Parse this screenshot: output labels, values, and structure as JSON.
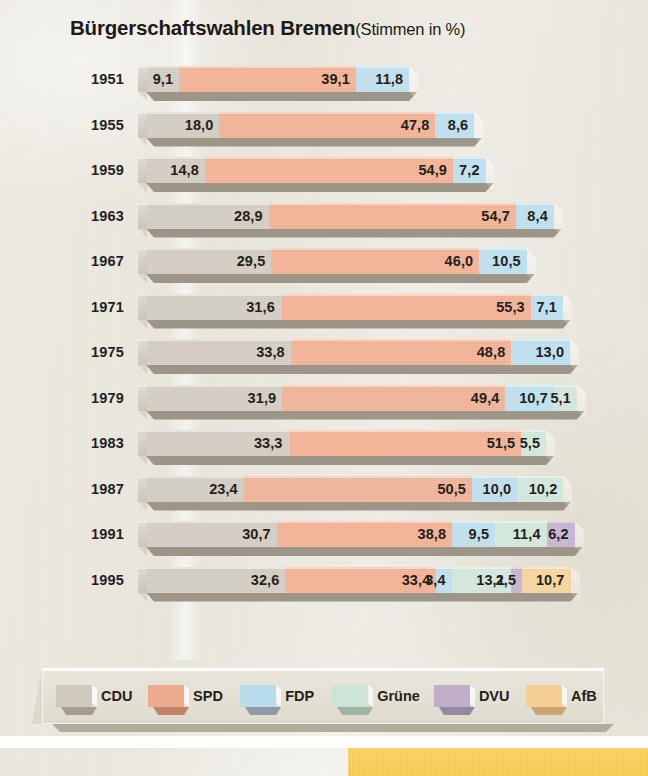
{
  "title": {
    "main": "Bürgerschaftswahlen Bremen",
    "sub": "(Stimmen in %)"
  },
  "legend": {
    "items": [
      {
        "label": "CDU",
        "color": "#cfc8bc",
        "shade": "#a59c8b",
        "key": "cdu"
      },
      {
        "label": "SPD",
        "color": "#eeac8e",
        "shade": "#c2836a",
        "key": "spd"
      },
      {
        "label": "FDP",
        "color": "#b9dcec",
        "shade": "#8d99a6",
        "key": "fdp"
      },
      {
        "label": "Grüne",
        "color": "#cfe4d8",
        "shade": "#9bb4a4",
        "key": "gruene"
      },
      {
        "label": "DVU",
        "color": "#c0aecb",
        "shade": "#9589a0",
        "key": "dvu"
      },
      {
        "label": "AfB",
        "color": "#f5cf94",
        "shade": "#c9a673",
        "key": "afb"
      }
    ]
  },
  "chart_data": {
    "type": "bar",
    "orientation": "horizontal",
    "stacked": true,
    "xlabel": "",
    "ylabel": "",
    "value_suffix": "%",
    "decimal_separator": ",",
    "categories": [
      "1951",
      "1955",
      "1959",
      "1963",
      "1967",
      "1971",
      "1975",
      "1979",
      "1983",
      "1987",
      "1991",
      "1995"
    ],
    "series": [
      {
        "name": "CDU",
        "color": "#cfc8bc",
        "values": [
          9.1,
          18.0,
          14.8,
          28.9,
          29.5,
          31.6,
          33.8,
          31.9,
          33.3,
          23.4,
          30.7,
          32.6
        ]
      },
      {
        "name": "SPD",
        "color": "#eeac8e",
        "values": [
          39.1,
          47.8,
          54.9,
          54.7,
          46.0,
          55.3,
          48.8,
          49.4,
          51.5,
          50.5,
          38.8,
          33.4
        ]
      },
      {
        "name": "FDP",
        "color": "#b9dcec",
        "values": [
          11.8,
          8.6,
          7.2,
          8.4,
          10.5,
          7.1,
          13.0,
          10.7,
          null,
          10.0,
          9.5,
          3.4
        ]
      },
      {
        "name": "Grüne",
        "color": "#cfe4d8",
        "values": [
          null,
          null,
          null,
          null,
          null,
          null,
          null,
          5.1,
          5.5,
          10.2,
          11.4,
          13.1
        ]
      },
      {
        "name": "DVU",
        "color": "#c0aecb",
        "values": [
          null,
          null,
          null,
          null,
          null,
          null,
          null,
          null,
          null,
          null,
          6.2,
          2.5
        ]
      },
      {
        "name": "AfB",
        "color": "#f5cf94",
        "values": [
          null,
          null,
          null,
          null,
          null,
          null,
          null,
          null,
          null,
          null,
          null,
          10.7
        ]
      }
    ],
    "rows": [
      {
        "year": "1951",
        "segments": [
          {
            "party": "CDU",
            "label": "9,1",
            "value": 9.1
          },
          {
            "party": "SPD",
            "label": "39,1",
            "value": 39.1
          },
          {
            "party": "FDP",
            "label": "11,8",
            "value": 11.8
          }
        ]
      },
      {
        "year": "1955",
        "segments": [
          {
            "party": "CDU",
            "label": "18,0",
            "value": 18.0
          },
          {
            "party": "SPD",
            "label": "47,8",
            "value": 47.8
          },
          {
            "party": "FDP",
            "label": "8,6",
            "value": 8.6
          }
        ]
      },
      {
        "year": "1959",
        "segments": [
          {
            "party": "CDU",
            "label": "14,8",
            "value": 14.8
          },
          {
            "party": "SPD",
            "label": "54,9",
            "value": 54.9
          },
          {
            "party": "FDP",
            "label": "7,2",
            "value": 7.2
          }
        ]
      },
      {
        "year": "1963",
        "segments": [
          {
            "party": "CDU",
            "label": "28,9",
            "value": 28.9
          },
          {
            "party": "SPD",
            "label": "54,7",
            "value": 54.7
          },
          {
            "party": "FDP",
            "label": "8,4",
            "value": 8.4
          }
        ]
      },
      {
        "year": "1967",
        "segments": [
          {
            "party": "CDU",
            "label": "29,5",
            "value": 29.5
          },
          {
            "party": "SPD",
            "label": "46,0",
            "value": 46.0
          },
          {
            "party": "FDP",
            "label": "10,5",
            "value": 10.5
          }
        ]
      },
      {
        "year": "1971",
        "segments": [
          {
            "party": "CDU",
            "label": "31,6",
            "value": 31.6
          },
          {
            "party": "SPD",
            "label": "55,3",
            "value": 55.3
          },
          {
            "party": "FDP",
            "label": "7,1",
            "value": 7.1
          }
        ]
      },
      {
        "year": "1975",
        "segments": [
          {
            "party": "CDU",
            "label": "33,8",
            "value": 33.8
          },
          {
            "party": "SPD",
            "label": "48,8",
            "value": 48.8
          },
          {
            "party": "FDP",
            "label": "13,0",
            "value": 13.0
          }
        ]
      },
      {
        "year": "1979",
        "segments": [
          {
            "party": "CDU",
            "label": "31,9",
            "value": 31.9
          },
          {
            "party": "SPD",
            "label": "49,4",
            "value": 49.4
          },
          {
            "party": "FDP",
            "label": "10,7",
            "value": 10.7
          },
          {
            "party": "Grüne",
            "label": "5,1",
            "value": 5.1
          }
        ]
      },
      {
        "year": "1983",
        "segments": [
          {
            "party": "CDU",
            "label": "33,3",
            "value": 33.3
          },
          {
            "party": "SPD",
            "label": "51,5",
            "value": 51.5
          },
          {
            "party": "Grüne",
            "label": "5,5",
            "value": 5.5
          }
        ]
      },
      {
        "year": "1987",
        "segments": [
          {
            "party": "CDU",
            "label": "23,4",
            "value": 23.4
          },
          {
            "party": "SPD",
            "label": "50,5",
            "value": 50.5
          },
          {
            "party": "FDP",
            "label": "10,0",
            "value": 10.0
          },
          {
            "party": "Grüne",
            "label": "10,2",
            "value": 10.2
          }
        ]
      },
      {
        "year": "1991",
        "segments": [
          {
            "party": "CDU",
            "label": "30,7",
            "value": 30.7
          },
          {
            "party": "SPD",
            "label": "38,8",
            "value": 38.8
          },
          {
            "party": "FDP",
            "label": "9,5",
            "value": 9.5
          },
          {
            "party": "Grüne",
            "label": "11,4",
            "value": 11.4
          },
          {
            "party": "DVU",
            "label": "6,2",
            "value": 6.2
          }
        ]
      },
      {
        "year": "1995",
        "segments": [
          {
            "party": "CDU",
            "label": "32,6",
            "value": 32.6
          },
          {
            "party": "SPD",
            "label": "33,4",
            "value": 33.4
          },
          {
            "party": "FDP",
            "label": "3,4",
            "value": 3.4
          },
          {
            "party": "Grüne",
            "label": "13,1",
            "value": 13.1
          },
          {
            "party": "DVU",
            "label": "2,5",
            "value": 2.5
          },
          {
            "party": "AfB",
            "label": "10,7",
            "value": 10.7
          }
        ]
      }
    ]
  }
}
